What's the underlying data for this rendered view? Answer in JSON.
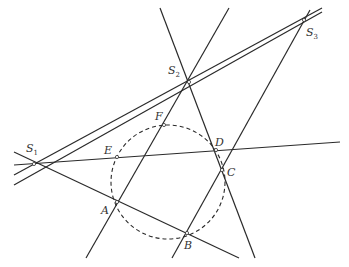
{
  "diagram": {
    "points": {
      "S1": {
        "label": "S",
        "sub": "1",
        "x": 34,
        "y": 164,
        "lx": 26,
        "ly": 152
      },
      "S2": {
        "label": "S",
        "sub": "2",
        "x": 189,
        "y": 82,
        "lx": 168,
        "ly": 74
      },
      "S3": {
        "label": "S",
        "sub": "3",
        "x": 304,
        "y": 20,
        "lx": 306,
        "ly": 36
      },
      "A": {
        "label": "A",
        "x": 117,
        "y": 202,
        "lx": 101,
        "ly": 214
      },
      "B": {
        "label": "B",
        "x": 187,
        "y": 233,
        "lx": 184,
        "ly": 249
      },
      "C": {
        "label": "C",
        "x": 222,
        "y": 170,
        "lx": 227,
        "ly": 176
      },
      "D": {
        "label": "D",
        "x": 216,
        "y": 150,
        "lx": 215,
        "ly": 146
      },
      "E": {
        "label": "E",
        "x": 117,
        "y": 157,
        "lx": 104,
        "ly": 154
      },
      "F": {
        "label": "F",
        "x": 164,
        "y": 125,
        "lx": 155,
        "ly": 120
      }
    },
    "circle": {
      "cx": 168,
      "cy": 182,
      "r": 57,
      "style": "dashed"
    },
    "lines": [
      {
        "name": "line-s1-s2-s3",
        "x1": 14,
        "y1": 175,
        "x2": 322,
        "y2": 8
      },
      {
        "name": "line-s1-e-d",
        "x1": 14,
        "y1": 165,
        "x2": 340,
        "y2": 142
      },
      {
        "name": "line-s1-a-b",
        "x1": 14,
        "y1": 152,
        "x2": 239,
        "y2": 258
      },
      {
        "name": "line-e-f-s3",
        "x1": 14,
        "y1": 185,
        "x2": 322,
        "y2": 12
      },
      {
        "name": "line-a-f-s2",
        "x1": 86,
        "y1": 258,
        "x2": 229,
        "y2": 8
      },
      {
        "name": "line-s2-d-c",
        "x1": 160,
        "y1": 8,
        "x2": 255,
        "y2": 258
      },
      {
        "name": "line-b-c-s3",
        "x1": 172,
        "y1": 258,
        "x2": 310,
        "y2": 10
      }
    ]
  }
}
